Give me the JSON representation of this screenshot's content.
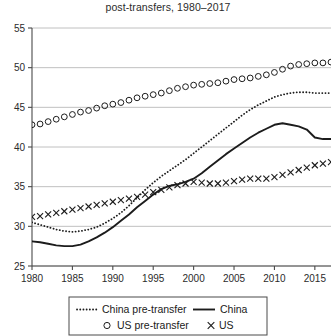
{
  "chart_data": {
    "type": "line",
    "title": "post-transfers, 1980–2017",
    "xlabel": "",
    "ylabel": "",
    "xlim": [
      1980,
      2017
    ],
    "ylim": [
      25,
      55
    ],
    "grid": true,
    "xticks": [
      1980,
      1985,
      1990,
      1995,
      2000,
      2005,
      2010,
      2015
    ],
    "xtick_labels": [
      "1980",
      "1985",
      "1990",
      "1995",
      "2000",
      "2005",
      "2010",
      "2015"
    ],
    "yticks": [
      25,
      30,
      35,
      40,
      45,
      50,
      55
    ],
    "ytick_labels": [
      "25",
      "30",
      "35",
      "40",
      "45",
      "50",
      "55"
    ],
    "legend_position": "below-axes",
    "x": [
      1980,
      1981,
      1982,
      1983,
      1984,
      1985,
      1986,
      1987,
      1988,
      1989,
      1990,
      1991,
      1992,
      1993,
      1994,
      1995,
      1996,
      1997,
      1998,
      1999,
      2000,
      2001,
      2002,
      2003,
      2004,
      2005,
      2006,
      2007,
      2008,
      2009,
      2010,
      2011,
      2012,
      2013,
      2014,
      2015,
      2016,
      2017
    ],
    "series": [
      {
        "name": "China pre-transfer",
        "style": "dotted",
        "marker": "none",
        "values": [
          30.5,
          30.2,
          29.9,
          29.6,
          29.4,
          29.3,
          29.4,
          29.6,
          29.9,
          30.4,
          31.0,
          31.7,
          32.6,
          33.6,
          34.6,
          35.5,
          36.3,
          37.0,
          37.7,
          38.4,
          39.2,
          40.0,
          40.8,
          41.6,
          42.4,
          43.2,
          44.0,
          44.7,
          45.3,
          45.8,
          46.3,
          46.6,
          46.8,
          46.9,
          46.9,
          46.8,
          46.8,
          46.8
        ]
      },
      {
        "name": "China",
        "style": "solid",
        "marker": "none",
        "values": [
          28.1,
          28.0,
          27.8,
          27.6,
          27.5,
          27.5,
          27.7,
          28.1,
          28.6,
          29.2,
          29.9,
          30.7,
          31.5,
          32.4,
          33.2,
          34.0,
          34.7,
          35.1,
          35.3,
          35.6,
          36.0,
          36.7,
          37.5,
          38.3,
          39.1,
          39.8,
          40.5,
          41.2,
          41.8,
          42.3,
          42.8,
          43.0,
          42.8,
          42.6,
          42.2,
          41.2,
          41.0,
          41.0
        ]
      },
      {
        "name": "US pre-transfer",
        "style": "none",
        "marker": "circle",
        "values": [
          42.8,
          42.9,
          43.2,
          43.5,
          43.8,
          44.1,
          44.4,
          44.6,
          44.9,
          45.2,
          45.4,
          45.6,
          45.9,
          46.2,
          46.4,
          46.6,
          46.8,
          47.1,
          47.4,
          47.6,
          47.8,
          47.9,
          48.0,
          48.1,
          48.3,
          48.5,
          48.6,
          48.7,
          48.9,
          49.1,
          49.4,
          49.8,
          50.2,
          50.4,
          50.5,
          50.6,
          50.6,
          50.7
        ]
      },
      {
        "name": "US",
        "style": "none",
        "marker": "x",
        "values": [
          31.2,
          31.3,
          31.5,
          31.7,
          31.9,
          32.1,
          32.3,
          32.5,
          32.7,
          32.9,
          33.1,
          33.3,
          33.5,
          33.7,
          34.0,
          34.3,
          34.6,
          34.9,
          35.2,
          35.4,
          35.6,
          35.5,
          35.4,
          35.4,
          35.5,
          35.7,
          35.9,
          36.0,
          36.0,
          36.0,
          36.2,
          36.5,
          36.8,
          37.1,
          37.4,
          37.7,
          37.9,
          38.1
        ]
      }
    ],
    "legend": [
      {
        "label": "China pre-transfer",
        "style": "dotted",
        "marker": "none"
      },
      {
        "label": "China",
        "style": "solid",
        "marker": "none"
      },
      {
        "label": "US pre-transfer",
        "style": "none",
        "marker": "circle"
      },
      {
        "label": "US",
        "style": "none",
        "marker": "x"
      }
    ]
  }
}
